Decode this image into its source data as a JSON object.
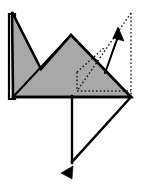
{
  "diagram": {
    "kind": "origami-fold-instruction",
    "canvas": {
      "width": 142,
      "height": 189,
      "background": "#ffffff"
    },
    "colors": {
      "paper_fill": "#a8a8a8",
      "paper_outline": "#000000",
      "fold_guide": "#1a1a1a",
      "arrow": "#000000",
      "background": "#ffffff",
      "flap_edge": "#ffffff"
    },
    "stroke_widths": {
      "outline": 2.6,
      "thin_crease": 1.8,
      "dotted_guide": 1.4,
      "arrow_shaft": 2.0
    },
    "shapes": {
      "main_body": {
        "name": "folded-paper-body",
        "fill": "#a8a8a8",
        "points": "12,12 41,69 71,35 131,97 13,97"
      },
      "left_flap": {
        "name": "left-under-flap",
        "fill": "#ffffff",
        "points": "9,14 9,99 15,99 15,14"
      },
      "crease_left_diagonal": {
        "name": "crease-line-left-diagonal",
        "from": "13,97",
        "to": "71,35"
      },
      "lower_triangle": {
        "name": "lower-white-triangle",
        "fill": "#ffffff",
        "points": "72,97 131,97 72,162"
      }
    },
    "guides": {
      "dotted_vertical_right": {
        "name": "guide-dotted-right-vertical",
        "x1": 131,
        "y1": 13,
        "x2": 131,
        "y2": 97
      },
      "dotted_diagonal": {
        "name": "guide-dotted-diagonal",
        "x1": 131,
        "y1": 13,
        "x2": 77,
        "y2": 91
      },
      "dotted_inner_vertical": {
        "name": "guide-dotted-inner-vertical",
        "x1": 77,
        "y1": 72,
        "x2": 77,
        "y2": 91
      },
      "dotted_horizontal": {
        "name": "guide-dotted-horizontal",
        "x1": 77,
        "y1": 91,
        "x2": 131,
        "y2": 91
      },
      "dotted_inner_diagonal": {
        "name": "guide-dotted-inner-diagonal",
        "x1": 77,
        "y1": 72,
        "x2": 104,
        "y2": 48
      }
    },
    "arrows": {
      "fold_up_arrow": {
        "name": "fold-direction-arrow-up",
        "label": "fold up / unfold",
        "path": "M 105,73 C 110,60 114,46 119,35",
        "head_points": "118,27 124,41 113,38"
      },
      "tuck_arrow": {
        "name": "tuck-direction-arrowhead",
        "label": "tuck / push in",
        "head_points": "61,173 73,166 72,179"
      }
    },
    "creases": {
      "vertical_center": {
        "name": "crease-center-vertical",
        "x1": 72,
        "y1": 96,
        "x2": 72,
        "y2": 163
      },
      "right_diagonal": {
        "name": "crease-right-diagonal",
        "x1": 131,
        "y1": 97,
        "x2": 72,
        "y2": 162
      },
      "baseline": {
        "name": "crease-baseline",
        "x1": 13,
        "y1": 97,
        "x2": 131,
        "y2": 97
      }
    }
  }
}
